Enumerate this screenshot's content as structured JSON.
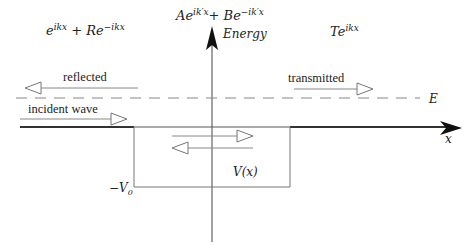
{
  "diagram": {
    "type": "quantum-square-well-scattering",
    "axes": {
      "vertical_label": "Energy",
      "horizontal_label": "x"
    },
    "wavefunctions": {
      "left": {
        "base": "e",
        "sup1": "ikx",
        "plus": " + R",
        "base2": "e",
        "sup2": "−ikx"
      },
      "middle": {
        "coefA": "A",
        "base": "e",
        "sup1": "ik′x",
        "plus": "+ B",
        "base2": "e",
        "sup2": "−ik′x"
      },
      "right": {
        "coef": "T",
        "base": "e",
        "sup": "ikx"
      }
    },
    "arrows": {
      "reflected": "reflected",
      "incident": "incident wave",
      "transmitted": "transmitted"
    },
    "energy_level_label": "E",
    "potential_label": "V(x)",
    "well_depth_label": {
      "sign": "−",
      "symbol": "V",
      "subscript": "0"
    },
    "colors": {
      "ink": "#222222",
      "thin_line": "#8a8a8a",
      "dashed": "#8a8a8a",
      "axis": "#333333",
      "background": "#ffffff"
    }
  }
}
